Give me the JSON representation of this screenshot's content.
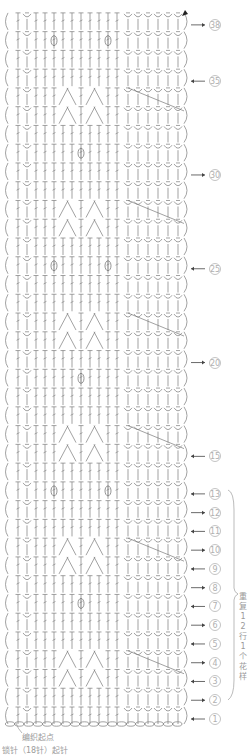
{
  "chart": {
    "rows": 38,
    "columns": 18,
    "stitch_color": "#7a7a7a",
    "label_color": "#9a9a9a",
    "row_labels": [
      {
        "row": 38,
        "text": "38",
        "dir": "right"
      },
      {
        "row": 35,
        "text": "35",
        "dir": "left"
      },
      {
        "row": 30,
        "text": "30",
        "dir": "right"
      },
      {
        "row": 25,
        "text": "25",
        "dir": "left"
      },
      {
        "row": 20,
        "text": "20",
        "dir": "right"
      },
      {
        "row": 15,
        "text": "15",
        "dir": "left"
      },
      {
        "row": 13,
        "text": "13",
        "dir": "left"
      },
      {
        "row": 12,
        "text": "12",
        "dir": "right"
      },
      {
        "row": 11,
        "text": "11",
        "dir": "left"
      },
      {
        "row": 10,
        "text": "10",
        "dir": "right"
      },
      {
        "row": 9,
        "text": "9",
        "dir": "left"
      },
      {
        "row": 8,
        "text": "8",
        "dir": "right"
      },
      {
        "row": 7,
        "text": "7",
        "dir": "left"
      },
      {
        "row": 6,
        "text": "6",
        "dir": "right"
      },
      {
        "row": 5,
        "text": "5",
        "dir": "left"
      },
      {
        "row": 4,
        "text": "4",
        "dir": "right"
      },
      {
        "row": 3,
        "text": "3",
        "dir": "left"
      },
      {
        "row": 2,
        "text": "2",
        "dir": "right"
      },
      {
        "row": 1,
        "text": "1",
        "dir": "left"
      }
    ],
    "repeat_note": "重复12行1个花样",
    "start_label": "编织起点",
    "foundation_label": "锁针（18针）起针"
  }
}
